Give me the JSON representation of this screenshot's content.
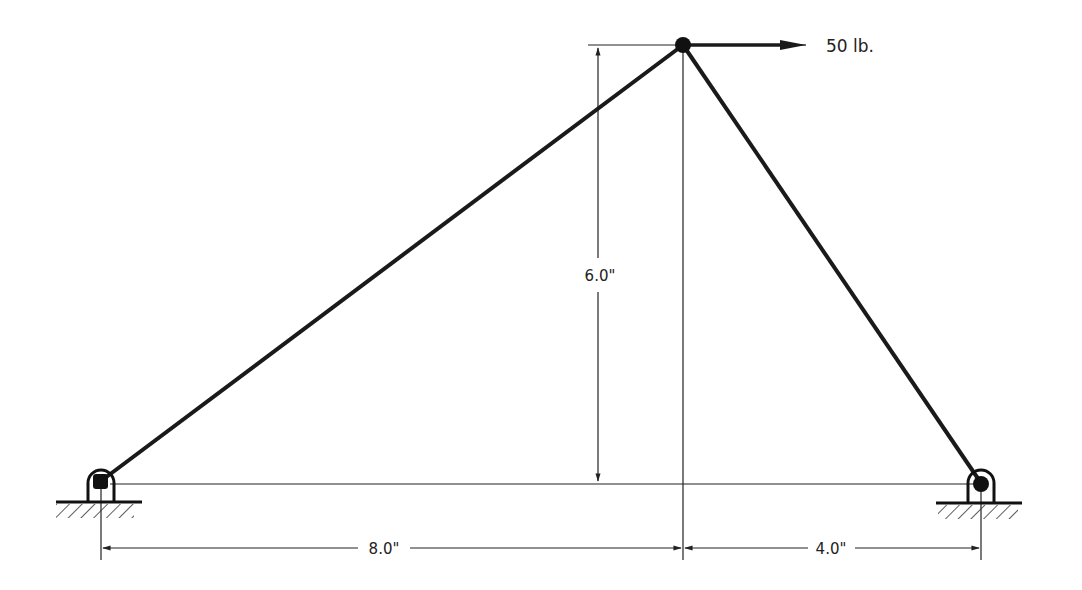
{
  "diagram": {
    "type": "truss",
    "members": [
      {
        "name": "left-member",
        "from": "left-support",
        "to": "apex"
      },
      {
        "name": "right-member",
        "from": "apex",
        "to": "right-support"
      }
    ],
    "joints": {
      "apex": {
        "x": 683,
        "y": 45
      },
      "left_support": {
        "x": 101,
        "y": 481
      },
      "right_support": {
        "x": 981,
        "y": 483
      }
    },
    "load": {
      "label": "50 lb.",
      "direction": "right",
      "applied_at": "apex"
    },
    "dimensions": {
      "height": "6.0\"",
      "left_span": "8.0\"",
      "right_span": "4.0\""
    },
    "supports": [
      {
        "name": "left-pin-support",
        "type": "pin"
      },
      {
        "name": "right-pin-support",
        "type": "pin"
      }
    ],
    "colors": {
      "member": "#1a1a1a",
      "line": "#222222",
      "background": "#ffffff"
    }
  }
}
